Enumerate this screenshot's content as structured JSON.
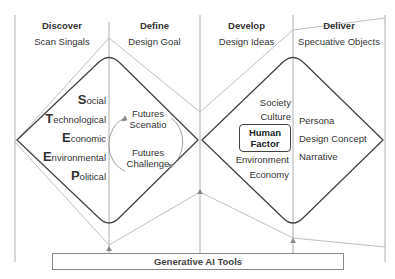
{
  "phases": [
    {
      "title": "Discover",
      "subtitle": "Scan Singals"
    },
    {
      "title": "Define",
      "subtitle": "Design Goal"
    },
    {
      "title": "Develop",
      "subtitle": "Design Ideas"
    },
    {
      "title": "Deliver",
      "subtitle": "Specuative Objects"
    }
  ],
  "steep": [
    {
      "cap": "S",
      "rest": "ocial"
    },
    {
      "cap": "T",
      "rest": "echnological"
    },
    {
      "cap": "E",
      "rest": "conomic"
    },
    {
      "cap": "E",
      "rest": "nvironmental"
    },
    {
      "cap": "P",
      "rest": "olitical"
    }
  ],
  "define_cycle": {
    "top": [
      "Futures",
      "Scenatio"
    ],
    "bottom": [
      "Futures",
      "Challenge"
    ]
  },
  "develop_items": {
    "above": [
      "Society",
      "Culture"
    ],
    "center": [
      "Human",
      "Factor"
    ],
    "below": [
      "Environment",
      "Economy"
    ]
  },
  "deliver_items": [
    "Persona",
    "Design Concept",
    "Narrative"
  ],
  "bottom_box": "Generative AI Tools",
  "colors": {
    "dark_line": "#444444",
    "grey_line": "#b0b0b0",
    "divider": "#9a9a9a"
  }
}
